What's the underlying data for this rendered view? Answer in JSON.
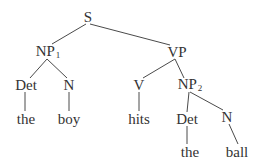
{
  "diagram": {
    "type": "syntax-tree",
    "colors": {
      "text": "#333333",
      "line": "#4a4a4a",
      "background": "#ffffff"
    },
    "nodes": [
      {
        "id": "S",
        "label": "S",
        "sub": "",
        "x": 88,
        "y": 17
      },
      {
        "id": "NP1",
        "label": "NP",
        "sub": "1",
        "x": 48,
        "y": 52
      },
      {
        "id": "VP",
        "label": "VP",
        "sub": "",
        "x": 177,
        "y": 52
      },
      {
        "id": "Det1",
        "label": "Det",
        "sub": "",
        "x": 26,
        "y": 85
      },
      {
        "id": "N1",
        "label": "N",
        "sub": "",
        "x": 69,
        "y": 85
      },
      {
        "id": "the1",
        "label": "the",
        "sub": "",
        "x": 26,
        "y": 119
      },
      {
        "id": "boy",
        "label": "boy",
        "sub": "",
        "x": 69,
        "y": 119
      },
      {
        "id": "V",
        "label": "V",
        "sub": "",
        "x": 139,
        "y": 85
      },
      {
        "id": "NP2",
        "label": "NP",
        "sub": "2",
        "x": 190,
        "y": 85
      },
      {
        "id": "hits",
        "label": "hits",
        "sub": "",
        "x": 139,
        "y": 119
      },
      {
        "id": "Det2",
        "label": "Det",
        "sub": "",
        "x": 187,
        "y": 119
      },
      {
        "id": "N2",
        "label": "N",
        "sub": "",
        "x": 227,
        "y": 117
      },
      {
        "id": "the2",
        "label": "the",
        "sub": "",
        "x": 190,
        "y": 152
      },
      {
        "id": "ball",
        "label": "ball",
        "sub": "",
        "x": 237,
        "y": 152
      }
    ],
    "edges": [
      {
        "from": "S",
        "to": "NP1",
        "x1": 86,
        "y1": 24,
        "x2": 52,
        "y2": 44
      },
      {
        "from": "S",
        "to": "VP",
        "x1": 90,
        "y1": 24,
        "x2": 170,
        "y2": 45
      },
      {
        "from": "NP1",
        "to": "Det1",
        "x1": 47,
        "y1": 59,
        "x2": 30,
        "y2": 78
      },
      {
        "from": "NP1",
        "to": "N1",
        "x1": 47,
        "y1": 59,
        "x2": 67,
        "y2": 78
      },
      {
        "from": "Det1",
        "to": "the1",
        "x1": 25,
        "y1": 92,
        "x2": 25,
        "y2": 111
      },
      {
        "from": "N1",
        "to": "boy",
        "x1": 69,
        "y1": 92,
        "x2": 69,
        "y2": 111
      },
      {
        "from": "VP",
        "to": "V",
        "x1": 175,
        "y1": 59,
        "x2": 143,
        "y2": 78
      },
      {
        "from": "VP",
        "to": "NP2",
        "x1": 175,
        "y1": 59,
        "x2": 184,
        "y2": 78
      },
      {
        "from": "V",
        "to": "hits",
        "x1": 139,
        "y1": 92,
        "x2": 139,
        "y2": 111
      },
      {
        "from": "NP2",
        "to": "Det2",
        "x1": 189,
        "y1": 92,
        "x2": 187,
        "y2": 112
      },
      {
        "from": "NP2",
        "to": "N2",
        "x1": 190,
        "y1": 92,
        "x2": 223,
        "y2": 110
      },
      {
        "from": "Det2",
        "to": "the2",
        "x1": 187,
        "y1": 126,
        "x2": 187,
        "y2": 144
      },
      {
        "from": "N2",
        "to": "ball",
        "x1": 229,
        "y1": 124,
        "x2": 238,
        "y2": 144
      }
    ]
  }
}
